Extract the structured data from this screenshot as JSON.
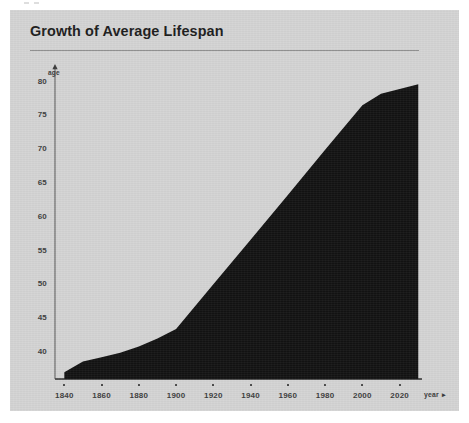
{
  "card": {
    "title": "Growth of Average Lifespan",
    "background_color": "#d4d4d4",
    "rule_color": "#8d8d8d"
  },
  "chart_data": {
    "type": "area",
    "title": "Growth of Average Lifespan",
    "xlabel": "year",
    "ylabel": "age",
    "xaxis_arrow": "▸",
    "yaxis_arrow": "▴",
    "series_color": "#121212",
    "grid": false,
    "legend": null,
    "xlim": [
      1835,
      2032
    ],
    "ylim": [
      36,
      82
    ],
    "xticks": [
      "1840",
      "1860",
      "1880",
      "1900",
      "1920",
      "1940",
      "1960",
      "1980",
      "2000",
      "2020"
    ],
    "xtick_values": [
      1840,
      1860,
      1880,
      1900,
      1920,
      1940,
      1960,
      1980,
      2000,
      2020
    ],
    "yticks": [
      "40",
      "45",
      "50",
      "55",
      "60",
      "65",
      "70",
      "75",
      "80"
    ],
    "ytick_values": [
      40,
      45,
      50,
      55,
      60,
      65,
      70,
      75,
      80
    ],
    "x": [
      1840,
      1850,
      1860,
      1870,
      1880,
      1890,
      1900,
      1920,
      1940,
      1960,
      1980,
      2000,
      2010,
      2030
    ],
    "values": [
      37.0,
      38.6,
      39.2,
      39.9,
      40.8,
      42.0,
      43.4,
      50.0,
      56.6,
      63.2,
      69.9,
      76.5,
      78.2,
      79.6
    ],
    "series": [
      {
        "name": "Average lifespan",
        "values": [
          37.0,
          38.6,
          39.2,
          39.9,
          40.8,
          42.0,
          43.4,
          50.0,
          56.6,
          63.2,
          69.9,
          76.5,
          78.2,
          79.6
        ]
      }
    ],
    "annotations": []
  }
}
